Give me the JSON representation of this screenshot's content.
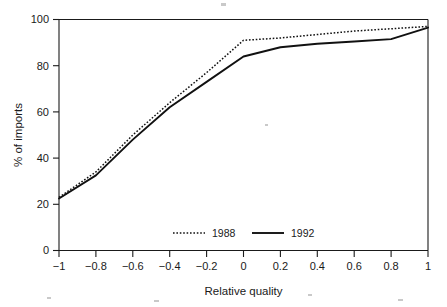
{
  "chart_data": {
    "type": "line",
    "title": "",
    "xlabel": "Relative quality",
    "ylabel": "% of imports",
    "xlim": [
      -1,
      1
    ],
    "ylim": [
      0,
      100
    ],
    "grid": false,
    "legend_position": "bottom-center",
    "xticks": [
      -1,
      -0.8,
      -0.6,
      -0.4,
      -0.2,
      0,
      0.2,
      0.4,
      0.6,
      0.8,
      1
    ],
    "xticklabels": [
      "−1",
      "−0.8",
      "−0.6",
      "−0.4",
      "−0.2",
      "0",
      "0.2",
      "0.4",
      "0.6",
      "0.8",
      "1"
    ],
    "yticks": [
      0,
      20,
      40,
      60,
      80,
      100
    ],
    "yticklabels": [
      "0",
      "20",
      "40",
      "60",
      "80",
      "100"
    ],
    "series": [
      {
        "name": "1988",
        "style": "dotted",
        "x": [
          -1,
          -0.8,
          -0.6,
          -0.4,
          -0.2,
          0,
          0.2,
          0.4,
          0.6,
          0.8,
          1
        ],
        "values": [
          23,
          34,
          50,
          64,
          77,
          91,
          92,
          93.5,
          95,
          96,
          97
        ]
      },
      {
        "name": "1992",
        "style": "solid",
        "x": [
          -1,
          -0.8,
          -0.6,
          -0.4,
          -0.2,
          0,
          0.2,
          0.4,
          0.6,
          0.8,
          1
        ],
        "values": [
          22.5,
          32.5,
          48,
          62,
          73,
          84,
          88,
          89.5,
          90.5,
          91.5,
          96.5
        ]
      }
    ]
  },
  "legend": {
    "entries": [
      {
        "label": "1988",
        "style": "dotted"
      },
      {
        "label": "1992",
        "style": "solid"
      }
    ]
  },
  "axes": {
    "x_title": "Relative quality",
    "y_title": "% of imports"
  }
}
